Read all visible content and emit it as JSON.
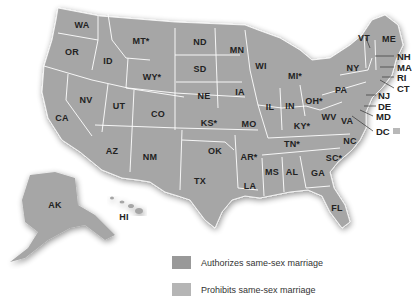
{
  "colors": {
    "authorizes": "#999999",
    "prohibits": "#b5b5b5",
    "border": "#ffffff",
    "background": "#ffffff",
    "text": "#222222"
  },
  "states": [
    {
      "abbr": "WA",
      "x": 82,
      "y": 25
    },
    {
      "abbr": "OR",
      "x": 72,
      "y": 52
    },
    {
      "abbr": "ID",
      "x": 108,
      "y": 61
    },
    {
      "abbr": "MT*",
      "x": 141,
      "y": 41
    },
    {
      "abbr": "WY*",
      "x": 152,
      "y": 77
    },
    {
      "abbr": "ND",
      "x": 200,
      "y": 42
    },
    {
      "abbr": "SD",
      "x": 200,
      "y": 69
    },
    {
      "abbr": "NE",
      "x": 204,
      "y": 96
    },
    {
      "abbr": "MN",
      "x": 237,
      "y": 50
    },
    {
      "abbr": "WI",
      "x": 261,
      "y": 66
    },
    {
      "abbr": "MI*",
      "x": 295,
      "y": 76
    },
    {
      "abbr": "IA",
      "x": 240,
      "y": 92
    },
    {
      "abbr": "IL",
      "x": 270,
      "y": 107
    },
    {
      "abbr": "IN",
      "x": 290,
      "y": 106
    },
    {
      "abbr": "OH*",
      "x": 314,
      "y": 101
    },
    {
      "abbr": "NV",
      "x": 86,
      "y": 100
    },
    {
      "abbr": "UT",
      "x": 119,
      "y": 106
    },
    {
      "abbr": "CO",
      "x": 158,
      "y": 114
    },
    {
      "abbr": "CA",
      "x": 62,
      "y": 118
    },
    {
      "abbr": "KS*",
      "x": 209,
      "y": 123
    },
    {
      "abbr": "MO",
      "x": 249,
      "y": 124
    },
    {
      "abbr": "KY*",
      "x": 302,
      "y": 126
    },
    {
      "abbr": "WV",
      "x": 329,
      "y": 117
    },
    {
      "abbr": "VA",
      "x": 347,
      "y": 121
    },
    {
      "abbr": "AZ",
      "x": 112,
      "y": 151
    },
    {
      "abbr": "NM",
      "x": 150,
      "y": 157
    },
    {
      "abbr": "OK",
      "x": 215,
      "y": 151
    },
    {
      "abbr": "AR*",
      "x": 249,
      "y": 157
    },
    {
      "abbr": "TN*",
      "x": 292,
      "y": 144
    },
    {
      "abbr": "NC",
      "x": 350,
      "y": 141
    },
    {
      "abbr": "SC*",
      "x": 334,
      "y": 158
    },
    {
      "abbr": "TX",
      "x": 200,
      "y": 181
    },
    {
      "abbr": "LA",
      "x": 250,
      "y": 186
    },
    {
      "abbr": "MS",
      "x": 272,
      "y": 172
    },
    {
      "abbr": "AL",
      "x": 292,
      "y": 172
    },
    {
      "abbr": "GA",
      "x": 318,
      "y": 173
    },
    {
      "abbr": "FL",
      "x": 337,
      "y": 208
    },
    {
      "abbr": "NY",
      "x": 353,
      "y": 68
    },
    {
      "abbr": "PA",
      "x": 341,
      "y": 90
    },
    {
      "abbr": "VT",
      "x": 364,
      "y": 38
    },
    {
      "abbr": "ME",
      "x": 389,
      "y": 39
    },
    {
      "abbr": "AK",
      "x": 55,
      "y": 205
    },
    {
      "abbr": "HI",
      "x": 124,
      "y": 217
    }
  ],
  "callouts": [
    {
      "abbr": "NH",
      "x": 397,
      "y": 56
    },
    {
      "abbr": "MA",
      "x": 397,
      "y": 67
    },
    {
      "abbr": "RI",
      "x": 397,
      "y": 77
    },
    {
      "abbr": "CT",
      "x": 397,
      "y": 88
    },
    {
      "abbr": "NJ",
      "x": 378,
      "y": 95
    },
    {
      "abbr": "DE",
      "x": 378,
      "y": 106
    },
    {
      "abbr": "MD",
      "x": 376,
      "y": 116
    },
    {
      "abbr": "DC",
      "x": 376,
      "y": 131
    }
  ],
  "legend": [
    {
      "label": "Authorizes same-sex marriage",
      "color_key": "authorizes"
    },
    {
      "label": "Prohibits same-sex marriage",
      "color_key": "prohibits"
    }
  ]
}
